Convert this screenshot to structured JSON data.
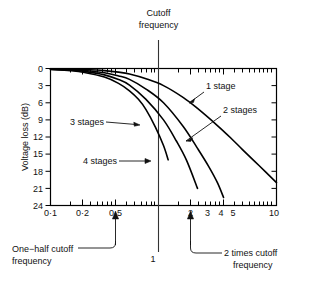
{
  "chart_data": {
    "type": "line",
    "title": "",
    "xlabel": "",
    "ylabel": "Voltage loss (dB)",
    "xscale": "log",
    "xlim": [
      0.1,
      10
    ],
    "ylim": [
      0,
      24
    ],
    "y_inverted": true,
    "grid": false,
    "legend": "inline-annotations",
    "x_tick_labels": [
      "0·1",
      "0·2",
      "0·5",
      "2",
      "3",
      "4",
      "5",
      "10"
    ],
    "x_tick_values": [
      0.1,
      0.2,
      0.5,
      2,
      3,
      4,
      5,
      10
    ],
    "y_tick_labels": [
      "0",
      "3",
      "6",
      "9",
      "12",
      "15",
      "18",
      "21",
      "24"
    ],
    "y_tick_values": [
      0,
      3,
      6,
      9,
      12,
      15,
      18,
      21,
      24
    ],
    "series": [
      {
        "name": "1 stage",
        "x": [
          0.1,
          0.15,
          0.2,
          0.3,
          0.4,
          0.5,
          0.7,
          1.0,
          1.5,
          2.0,
          3.0,
          4.0,
          5.0,
          7.0,
          10.0
        ],
        "values": [
          0.04,
          0.1,
          0.17,
          0.37,
          0.64,
          0.97,
          1.8,
          3.0,
          5.1,
          7.0,
          10.0,
          12.3,
          14.2,
          17.0,
          20.0
        ]
      },
      {
        "name": "2 stages",
        "x": [
          0.1,
          0.15,
          0.2,
          0.3,
          0.4,
          0.5,
          0.7,
          1.0,
          1.5,
          2.0,
          2.5,
          3.0,
          3.4
        ],
        "values": [
          0.09,
          0.19,
          0.34,
          0.75,
          1.3,
          1.9,
          3.6,
          6.0,
          10.2,
          14.0,
          17.1,
          20.0,
          22.6
        ]
      },
      {
        "name": "3 stages",
        "x": [
          0.1,
          0.15,
          0.2,
          0.3,
          0.4,
          0.5,
          0.7,
          1.0,
          1.3,
          1.6,
          2.0
        ],
        "values": [
          0.13,
          0.29,
          0.51,
          1.12,
          1.93,
          2.9,
          5.4,
          9.0,
          12.7,
          16.1,
          21.0
        ]
      },
      {
        "name": "4 stages",
        "x": [
          0.1,
          0.15,
          0.2,
          0.3,
          0.4,
          0.5,
          0.6,
          0.7,
          0.85,
          1.0,
          1.1
        ],
        "values": [
          0.17,
          0.38,
          0.69,
          1.5,
          2.6,
          3.9,
          5.4,
          7.2,
          10.3,
          13.5,
          16.0
        ]
      }
    ],
    "annotations": [
      {
        "id": "cutoff-frequency",
        "label": "Cutoff\nfrequency",
        "x_value": 1,
        "position": "top"
      },
      {
        "id": "one-stage",
        "label": "1 stage",
        "points_to_series": "1 stage"
      },
      {
        "id": "two-stages",
        "label": "2 stages",
        "points_to_series": "2 stages"
      },
      {
        "id": "three-stages",
        "label": "3 stages",
        "points_to_series": "3 stages"
      },
      {
        "id": "four-stages",
        "label": "4 stages",
        "points_to_series": "4 stages"
      },
      {
        "id": "one-half-cutoff",
        "label": "One−half cutoff\nfrequency",
        "x_value": 0.5,
        "position": "bottom"
      },
      {
        "id": "two-times-cutoff",
        "label": "2 times cutoff\nfrequency",
        "x_value": 2,
        "position": "bottom"
      },
      {
        "id": "cutoff-axis-value",
        "label": "1",
        "x_value": 1,
        "position": "bottom-axis"
      }
    ]
  },
  "labels": {
    "cutoff_line_1": "Cutoff",
    "cutoff_line_2": "frequency",
    "y_axis_title": "Voltage loss (dB)",
    "series_1": "1 stage",
    "series_2": "2 stages",
    "series_3": "3 stages",
    "series_4": "4 stages",
    "half_cutoff_line_1": "One−half cutoff",
    "half_cutoff_line_2": "frequency",
    "twice_cutoff_line_1": "2 times cutoff",
    "twice_cutoff_line_2": "frequency",
    "cutoff_axis_value": "1",
    "x_0_1": "0·1",
    "x_0_2": "0·2",
    "x_0_5": "0·5",
    "x_2": "2",
    "x_3": "3",
    "x_4": "4",
    "x_5": "5",
    "x_10": "10",
    "y_0": "0",
    "y_3": "3",
    "y_6": "6",
    "y_9": "9",
    "y_12": "12",
    "y_15": "15",
    "y_18": "18",
    "y_21": "21",
    "y_24": "24"
  },
  "colors": {
    "ink": "#000000",
    "background": "#ffffff",
    "annotation": "#111111"
  }
}
